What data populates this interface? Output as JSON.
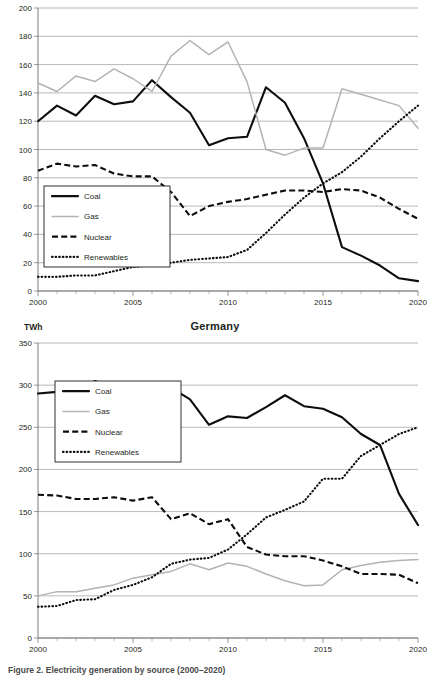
{
  "figure": {
    "caption": "Figure 2.  Electricity generation by source (2000–2020)"
  },
  "charts": [
    {
      "id": "top",
      "title": "",
      "unit": "",
      "x_ticks": [
        "2000",
        "2005",
        "2010",
        "2015",
        "2020"
      ],
      "y_ticks": [
        "0",
        "20",
        "40",
        "60",
        "80",
        "100",
        "120",
        "140",
        "160",
        "180",
        "200"
      ],
      "legend": [
        {
          "label": "Coal",
          "style": "solid",
          "color": "#0d0d0d"
        },
        {
          "label": "Gas",
          "style": "solid",
          "color": "#b3b3b3"
        },
        {
          "label": "Nuclear",
          "style": "dashed",
          "color": "#0d0d0d"
        },
        {
          "label": "Renewables",
          "style": "dotted",
          "color": "#0d0d0d"
        }
      ]
    },
    {
      "id": "bottom",
      "title": "Germany",
      "unit": "TWh",
      "x_ticks": [
        "2000",
        "2005",
        "2010",
        "2015",
        "2020"
      ],
      "y_ticks": [
        "0",
        "50",
        "100",
        "150",
        "200",
        "250",
        "300",
        "350"
      ],
      "legend": [
        {
          "label": "Coal",
          "style": "solid",
          "color": "#0d0d0d"
        },
        {
          "label": "Gas",
          "style": "solid",
          "color": "#b3b3b3"
        },
        {
          "label": "Nuclear",
          "style": "dashed",
          "color": "#0d0d0d"
        },
        {
          "label": "Renewables",
          "style": "dotted",
          "color": "#0d0d0d"
        }
      ]
    }
  ],
  "chart_data": [
    {
      "type": "line",
      "id": "top-chart",
      "title": "",
      "xlabel": "",
      "ylabel": "",
      "ylim": [
        0,
        200
      ],
      "ytick_step": 20,
      "xlim": [
        2000,
        2020
      ],
      "grid": "horizontal",
      "legend_position": "lower-left-inside",
      "x": [
        2000,
        2001,
        2002,
        2003,
        2004,
        2005,
        2006,
        2007,
        2008,
        2009,
        2010,
        2011,
        2012,
        2013,
        2014,
        2015,
        2016,
        2017,
        2018,
        2019,
        2020
      ],
      "series": [
        {
          "name": "Coal",
          "values": [
            120,
            131,
            124,
            138,
            132,
            134,
            149,
            137,
            126,
            103,
            108,
            109,
            144,
            133,
            108,
            76,
            31,
            25,
            18,
            9,
            7
          ]
        },
        {
          "name": "Gas",
          "values": [
            147,
            141,
            152,
            148,
            157,
            150,
            141,
            166,
            177,
            167,
            176,
            148,
            100,
            96,
            101,
            101,
            143,
            139,
            135,
            131,
            115
          ]
        },
        {
          "name": "Nuclear",
          "values": [
            85,
            90,
            88,
            89,
            83,
            81,
            81,
            70,
            53,
            60,
            63,
            65,
            68,
            71,
            71,
            70,
            72,
            71,
            66,
            58,
            51
          ]
        },
        {
          "name": "Renewables",
          "values": [
            10,
            10,
            11,
            11,
            14,
            17,
            18,
            20,
            22,
            23,
            24,
            29,
            41,
            54,
            66,
            76,
            84,
            95,
            108,
            120,
            131
          ]
        }
      ]
    },
    {
      "type": "line",
      "id": "germany-chart",
      "title": "Germany",
      "xlabel": "",
      "ylabel": "TWh",
      "ylim": [
        0,
        350
      ],
      "ytick_step": 50,
      "xlim": [
        2000,
        2020
      ],
      "grid": "horizontal",
      "legend_position": "upper-left-inside",
      "x": [
        2000,
        2001,
        2002,
        2003,
        2004,
        2005,
        2006,
        2007,
        2008,
        2009,
        2010,
        2011,
        2012,
        2013,
        2014,
        2015,
        2016,
        2017,
        2018,
        2019,
        2020
      ],
      "series": [
        {
          "name": "Coal",
          "values": [
            290,
            292,
            293,
            305,
            296,
            288,
            291,
            297,
            283,
            253,
            263,
            261,
            274,
            288,
            275,
            272,
            262,
            242,
            229,
            171,
            134
          ]
        },
        {
          "name": "Gas",
          "values": [
            50,
            55,
            55,
            59,
            63,
            71,
            75,
            79,
            88,
            81,
            89,
            85,
            76,
            68,
            62,
            63,
            81,
            86,
            90,
            92,
            93
          ]
        },
        {
          "name": "Nuclear",
          "values": [
            170,
            169,
            165,
            165,
            167,
            163,
            167,
            141,
            148,
            135,
            141,
            108,
            99,
            97,
            97,
            92,
            85,
            76,
            76,
            75,
            65
          ]
        },
        {
          "name": "Renewables",
          "values": [
            37,
            38,
            45,
            46,
            57,
            63,
            72,
            88,
            93,
            95,
            105,
            123,
            143,
            152,
            162,
            189,
            189,
            216,
            229,
            242,
            250
          ]
        }
      ]
    }
  ]
}
